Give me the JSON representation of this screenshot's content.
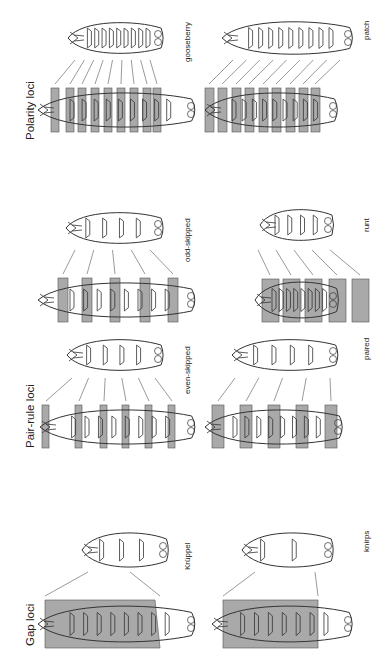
{
  "figure": {
    "orientation": "rotated-90-clockwise",
    "colors": {
      "band_fill": "#9a9a9a",
      "outline": "#333333",
      "background": "#ffffff"
    },
    "sections": [
      {
        "id": "polarity",
        "title": "Polarity loci",
        "panels": [
          {
            "mutant": "gooseberry",
            "bands": 9
          },
          {
            "mutant": "patch",
            "bands": 9
          }
        ]
      },
      {
        "id": "pair-rule",
        "title": "Pair-rule loci",
        "panels": [
          {
            "mutant": "odd-skipped",
            "bands": 5
          },
          {
            "mutant": "runt",
            "bands": 5
          },
          {
            "mutant": "even-skipped",
            "bands": 6
          },
          {
            "mutant": "paired",
            "bands": 5
          }
        ]
      },
      {
        "id": "gap",
        "title": "Gap loci",
        "panels": [
          {
            "mutant": "Krüppel",
            "bands": 1
          },
          {
            "mutant": "knirps",
            "bands": 1
          }
        ]
      }
    ]
  }
}
